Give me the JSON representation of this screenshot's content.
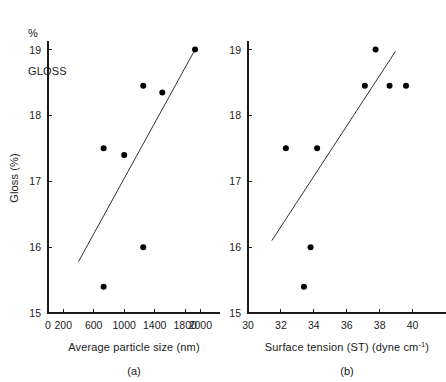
{
  "figure": {
    "supertitle_line1": "%",
    "supertitle_line2": "GLOSS",
    "background_color": "#ffffff",
    "ink_color": "#1a1a1a"
  },
  "chart_data": [
    {
      "type": "scatter",
      "panel_id": "a",
      "caption": "(a)",
      "title": "% GLOSS",
      "xlabel": "Average particle size (nm)",
      "ylabel": "Gloss (%)",
      "xlim": [
        0,
        2100
      ],
      "ylim": [
        15,
        19.1
      ],
      "xticks": [
        0,
        200,
        600,
        1000,
        1400,
        1800,
        2000
      ],
      "xticklabels": [
        "0",
        "200",
        "600",
        "1000",
        "1400",
        "1800",
        "2000"
      ],
      "yticks": [
        15,
        16,
        17,
        18,
        19
      ],
      "yticklabels": [
        "15",
        "16",
        "17",
        "18",
        "19"
      ],
      "grid": false,
      "legend": "none",
      "marker": "filled-circle",
      "points": [
        {
          "x": 730,
          "y": 17.5
        },
        {
          "x": 1000,
          "y": 17.4
        },
        {
          "x": 1250,
          "y": 18.45
        },
        {
          "x": 1500,
          "y": 18.35
        },
        {
          "x": 1930,
          "y": 19.0
        },
        {
          "x": 1250,
          "y": 16.0
        },
        {
          "x": 730,
          "y": 15.4
        }
      ],
      "trendline": {
        "x0": 400,
        "y0": 15.78,
        "x1": 1930,
        "y1": 19.0
      }
    },
    {
      "type": "scatter",
      "panel_id": "b",
      "caption": "(b)",
      "xlabel": "Surface tension (ST) (dyne cm",
      "xlabel_superscript": "-1",
      "xlabel_tail": ")",
      "ylabel": "Gloss (%)",
      "xlim": [
        30,
        41.3
      ],
      "ylim": [
        15,
        19.1
      ],
      "xticks": [
        30,
        32,
        34,
        36,
        38,
        40
      ],
      "xticklabels": [
        "30",
        "32",
        "34",
        "36",
        "38",
        "40"
      ],
      "yticks": [
        15,
        16,
        17,
        18,
        19
      ],
      "yticklabels": [
        "15",
        "16",
        "17",
        "18",
        "19"
      ],
      "grid": false,
      "legend": "none",
      "marker": "filled-circle",
      "points": [
        {
          "x": 32.3,
          "y": 17.5
        },
        {
          "x": 34.2,
          "y": 17.5
        },
        {
          "x": 37.1,
          "y": 18.45
        },
        {
          "x": 37.75,
          "y": 19.0
        },
        {
          "x": 38.6,
          "y": 18.45
        },
        {
          "x": 39.6,
          "y": 18.45
        },
        {
          "x": 33.8,
          "y": 16.0
        },
        {
          "x": 33.4,
          "y": 15.4
        }
      ],
      "trendline": {
        "x0": 31.45,
        "y0": 16.1,
        "x1": 38.95,
        "y1": 18.97
      }
    }
  ]
}
